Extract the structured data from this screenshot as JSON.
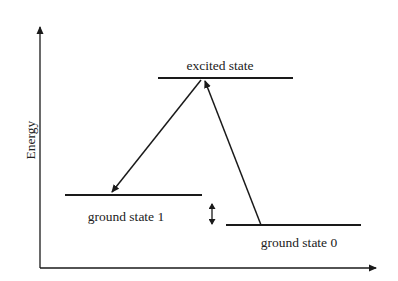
{
  "diagram": {
    "type": "energy-level-diagram",
    "axes": {
      "y_label": "Energy",
      "x_label": ""
    },
    "levels": [
      {
        "id": "excited",
        "label": "excited state",
        "x1": 158,
        "x2": 293,
        "y": 78
      },
      {
        "id": "ground1",
        "label": "ground state 1",
        "x1": 65,
        "x2": 202,
        "y": 195
      },
      {
        "id": "ground0",
        "label": "ground state 0",
        "x1": 226,
        "x2": 361,
        "y": 225
      }
    ],
    "transitions": [
      {
        "id": "absorption",
        "from": "ground state 0",
        "to": "excited state",
        "direction": "up"
      },
      {
        "id": "emission",
        "from": "excited state",
        "to": "ground state 1",
        "direction": "down"
      }
    ],
    "gap_indicator": {
      "between": [
        "ground state 1",
        "ground state 0"
      ],
      "style": "double-arrow"
    },
    "colors": {
      "stroke": "#1a1a1a",
      "text": "#222222",
      "background": "#ffffff"
    }
  }
}
